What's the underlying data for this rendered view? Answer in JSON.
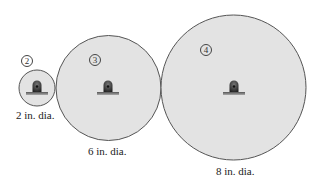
{
  "diagram": {
    "type": "pulley-gear-train",
    "background_color": "#ffffff",
    "circle_fill": "#e3e3e3",
    "circle_stroke": "#555555",
    "wheels": [
      {
        "id": "2",
        "tag": "2",
        "label": "2 in. dia.",
        "cx": 37,
        "cy": 88,
        "r": 18,
        "tag_x": 27,
        "tag_y": 61,
        "label_x": 16,
        "label_y": 110
      },
      {
        "id": "3",
        "tag": "3",
        "label": "6 in. dia.",
        "cx": 108,
        "cy": 88,
        "r": 52,
        "tag_x": 95,
        "tag_y": 60,
        "label_x": 88,
        "label_y": 146
      },
      {
        "id": "4",
        "tag": "4",
        "label": "8 in. dia.",
        "cx": 233,
        "cy": 88,
        "r": 72,
        "tag_x": 206,
        "tag_y": 50,
        "label_x": 216,
        "label_y": 166
      }
    ]
  }
}
